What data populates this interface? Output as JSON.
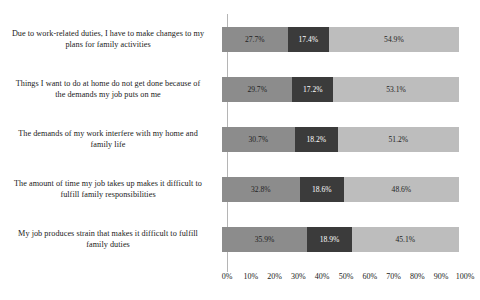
{
  "chart_data": {
    "type": "bar",
    "subtype": "horizontal-100-percent-stacked",
    "title": "",
    "subtitle": "",
    "xlabel": "",
    "ylabel": "",
    "xlim": [
      0,
      100
    ],
    "grid": false,
    "legend": "none",
    "orientation": "horizontal",
    "value_suffix": "%",
    "categories": [
      "Due to work-related duties, I have to make changes to my plans for family activities",
      "Things I want to do at home do not get done because of the demands my job puts on me",
      "The demands of my work interfere with my home and family life",
      "The amount of time my job takes up makes it difficult to fulfill family responsibilities",
      "My job produces strain that makes it difficult to fulfill family duties"
    ],
    "series": [
      {
        "name": "Segment 1",
        "color": "#8c8c8c",
        "values": [
          27.7,
          29.7,
          30.7,
          32.8,
          35.9
        ]
      },
      {
        "name": "Segment 2",
        "color": "#3b3b3b",
        "values": [
          17.4,
          17.2,
          18.2,
          18.6,
          18.9
        ]
      },
      {
        "name": "Segment 3",
        "color": "#bdbdbd",
        "values": [
          54.9,
          53.1,
          51.2,
          48.6,
          45.1
        ]
      }
    ],
    "tick_labels": [
      "0%",
      "10%",
      "20%",
      "30%",
      "40%",
      "50%",
      "60%",
      "70%",
      "80%",
      "90%",
      "100%"
    ],
    "tick_values": [
      0,
      10,
      20,
      30,
      40,
      50,
      60,
      70,
      80,
      90,
      100
    ],
    "bars": [
      {
        "category": "Due to work-related duties, I have to make changes to my plans for family activities",
        "category_line1": "Due to work-related duties, I have to make changes to my",
        "category_line2": "plans for family activities",
        "segments": [
          {
            "label": "27.7%",
            "value": 27.7,
            "color": "#8c8c8c"
          },
          {
            "label": "17.4%",
            "value": 17.4,
            "color": "#3b3b3b"
          },
          {
            "label": "54.9%",
            "value": 54.9,
            "color": "#bdbdbd"
          }
        ]
      },
      {
        "category": "Things I want to do at home do not get done because of the demands my job puts on me",
        "category_line1": "Things I want to do at home do not get done because of",
        "category_line2": "the demands my job puts on me",
        "segments": [
          {
            "label": "29.7%",
            "value": 29.7,
            "color": "#8c8c8c"
          },
          {
            "label": "17.2%",
            "value": 17.2,
            "color": "#3b3b3b"
          },
          {
            "label": "53.1%",
            "value": 53.1,
            "color": "#bdbdbd"
          }
        ]
      },
      {
        "category": "The demands of my work interfere with my home and family life",
        "category_line1": "The demands of my work interfere with my home and",
        "category_line2": "family life",
        "segments": [
          {
            "label": "30.7%",
            "value": 30.7,
            "color": "#8c8c8c"
          },
          {
            "label": "18.2%",
            "value": 18.2,
            "color": "#3b3b3b"
          },
          {
            "label": "51.2%",
            "value": 51.2,
            "color": "#bdbdbd"
          }
        ]
      },
      {
        "category": "The amount of time my job takes up makes it difficult to fulfill family responsibilities",
        "category_line1": "The amount of time my job takes up makes it difficult to",
        "category_line2": "fulfill family responsibilities",
        "segments": [
          {
            "label": "32.8%",
            "value": 32.8,
            "color": "#8c8c8c"
          },
          {
            "label": "18.6%",
            "value": 18.6,
            "color": "#3b3b3b"
          },
          {
            "label": "48.6%",
            "value": 48.6,
            "color": "#bdbdbd"
          }
        ]
      },
      {
        "category": "My job produces strain that makes it difficult to fulfill family duties",
        "category_line1": "My job produces strain that makes it difficult to fulfill",
        "category_line2": "family duties",
        "segments": [
          {
            "label": "35.9%",
            "value": 35.9,
            "color": "#8c8c8c"
          },
          {
            "label": "18.9%",
            "value": 18.9,
            "color": "#3b3b3b"
          },
          {
            "label": "45.1%",
            "value": 45.1,
            "color": "#bdbdbd"
          }
        ]
      }
    ]
  }
}
